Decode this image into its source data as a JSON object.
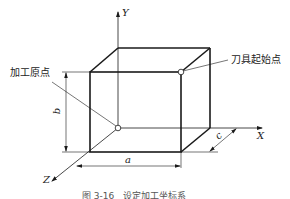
{
  "figure": {
    "labels": {
      "machining_origin": "加工原点",
      "tool_start_point": "刀具起始点"
    },
    "axes": {
      "x": "X",
      "y": "Y",
      "z": "Z"
    },
    "dimensions": {
      "a": "a",
      "b": "b",
      "c": "c"
    },
    "caption": "图 3-16　设定加工坐标系"
  },
  "colors": {
    "line": "#1a1a1a",
    "background": "#ffffff"
  }
}
